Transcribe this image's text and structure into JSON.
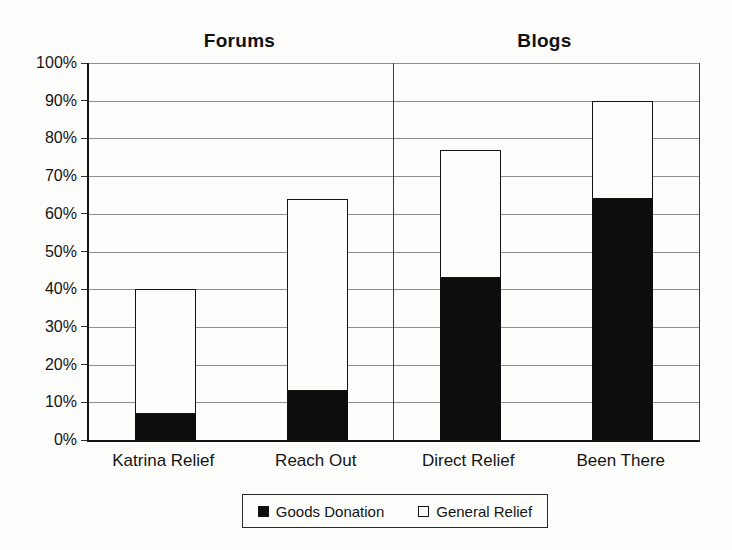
{
  "chart_data": {
    "type": "bar",
    "stacked": true,
    "sections": [
      {
        "label": "Forums",
        "categories": [
          "Katrina Relief",
          "Reach Out"
        ]
      },
      {
        "label": "Blogs",
        "categories": [
          "Direct Relief",
          "Been There"
        ]
      }
    ],
    "categories": [
      "Katrina Relief",
      "Reach Out",
      "Direct Relief",
      "Been There"
    ],
    "series": [
      {
        "name": "Goods Donation",
        "color": "#0d0d0d",
        "values": [
          7,
          13,
          43,
          64
        ]
      },
      {
        "name": "General Relief",
        "color": "#fdfdfb",
        "values": [
          33,
          51,
          34,
          26
        ]
      }
    ],
    "stack_totals": [
      40,
      64,
      77,
      90
    ],
    "ylim": [
      0,
      100
    ],
    "ytick_step": 10,
    "ytick_labels": [
      "0%",
      "10%",
      "20%",
      "30%",
      "40%",
      "50%",
      "60%",
      "70%",
      "80%",
      "90%",
      "100%"
    ],
    "grid": true,
    "legend_position": "bottom",
    "colors": {
      "ink": "#141414",
      "grid": "#8f8f8f",
      "background": "#fdfdfb"
    }
  }
}
